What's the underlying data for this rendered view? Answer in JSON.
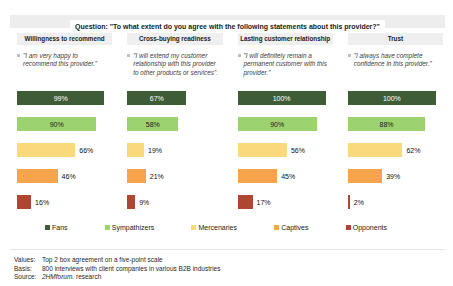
{
  "title": "Question: \"To what extent do you agree with the following statements about this provider?\"",
  "colors": {
    "band_gray": "#ededed",
    "header_gray": "#efefef",
    "dark_green": "#3e5c35",
    "light_green": "#9dd36e",
    "yellow": "#fad87c",
    "orange": "#f7a44c",
    "red": "#af4632",
    "inside_label_dark_bar": "#ffffff",
    "inside_label_light_bar": "#1a1a1a"
  },
  "chart_data": {
    "type": "bar",
    "orientation": "horizontal",
    "value_range": [
      0,
      100
    ],
    "value_suffix": "%",
    "grid": false,
    "legend_position": "bottom",
    "series_labels": [
      "Fans",
      "Sympathizers",
      "Mercenaries",
      "Captives",
      "Opponents"
    ],
    "series_colors": [
      "#3e5c35",
      "#9dd36e",
      "#fad87c",
      "#f7a44c",
      "#af4632"
    ],
    "label_placement_by_series": [
      "inside",
      "inside",
      "outside",
      "outside",
      "outside"
    ],
    "panels": [
      {
        "header": "Willingness to recommend",
        "quote": "\"I am very happy to recommend this provider.\"",
        "values": [
          99,
          90,
          66,
          46,
          16
        ]
      },
      {
        "header": "Cross-buying readiness",
        "quote": "\"I will extend my customer relationship with this provider to other products or services\".",
        "values": [
          67,
          58,
          19,
          21,
          9
        ]
      },
      {
        "header": "Lasting customer relationship",
        "quote": "\"I will definitely remain a permanent customer with this provider.\"",
        "values": [
          100,
          90,
          56,
          45,
          17
        ]
      },
      {
        "header": "Trust",
        "quote": "\"I always have complete confidence in this provider.\"",
        "values": [
          100,
          88,
          62,
          39,
          2
        ]
      }
    ]
  },
  "legend": [
    {
      "label": "Fans",
      "color": "#3e5c35"
    },
    {
      "label": "Sympathizers",
      "color": "#9dd36e"
    },
    {
      "label": "Mercenaries",
      "color": "#fad87c"
    },
    {
      "label": "Captives",
      "color": "#f7a44c"
    },
    {
      "label": "Opponents",
      "color": "#af4632"
    }
  ],
  "footer": {
    "values_label": "Values:",
    "values_text": "Top 2 box agreement on a five-point scale",
    "basis_label": "Basis:",
    "basis_text": "800 interviews with client companies in various B2B industries",
    "source_label": "Source:",
    "source_text_italic": "2HMforum.",
    "source_text_rest": " research"
  }
}
